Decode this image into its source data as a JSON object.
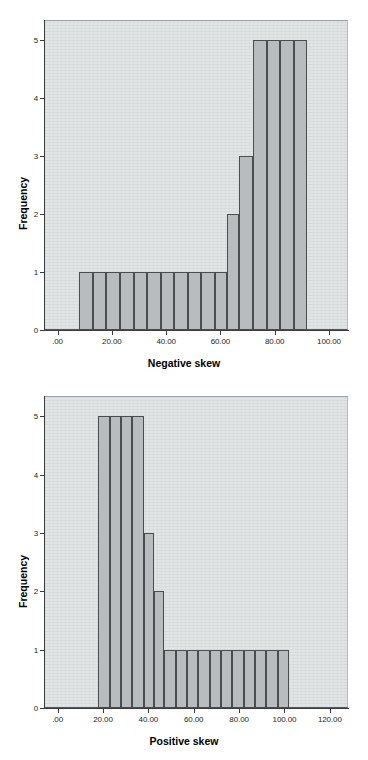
{
  "figure": {
    "background_color": "#ffffff",
    "plot_background_color": "#e2e5e6",
    "bar_fill_color": "#b9bcbe",
    "bar_border_color": "#4a4d50",
    "axis_color": "#3a3d40"
  },
  "charts": [
    {
      "id": "negative-skew-histogram",
      "title": "",
      "xlabel": "Negative skew",
      "ylabel": "Frequency",
      "x_tick_labels": [
        ".00",
        "20.00",
        "40.00",
        "60.00",
        "80.00",
        "100.00"
      ],
      "x_tick_values": [
        0,
        20,
        40,
        60,
        80,
        100
      ],
      "y_tick_labels": [
        "0",
        "1",
        "2",
        "3",
        "4",
        "5"
      ],
      "y_tick_values": [
        0,
        1,
        2,
        3,
        4,
        5
      ]
    },
    {
      "id": "positive-skew-histogram",
      "title": "",
      "xlabel": "Positive skew",
      "ylabel": "Frequency",
      "x_tick_labels": [
        ".00",
        "20.00",
        "40.00",
        "60.00",
        "80.00",
        "100.00",
        "120.00"
      ],
      "x_tick_values": [
        0,
        20,
        40,
        60,
        80,
        100,
        120
      ],
      "y_tick_labels": [
        "0",
        "1",
        "2",
        "3",
        "4",
        "5"
      ],
      "y_tick_values": [
        0,
        1,
        2,
        3,
        4,
        5
      ]
    }
  ],
  "chart_data": [
    {
      "type": "bar",
      "id": "negative-skew-histogram",
      "title": "Negative skew",
      "xlabel": "Negative skew",
      "ylabel": "Frequency",
      "xlim": [
        -5,
        107
      ],
      "ylim": [
        0,
        5.35
      ],
      "grid": false,
      "legend": "none",
      "bin_width": 5,
      "bin_edges": [
        8,
        13,
        18,
        23,
        28,
        33,
        38,
        43,
        48,
        53,
        58,
        62.5,
        67,
        72,
        77,
        82,
        87,
        92
      ],
      "categories": [
        "8-13",
        "13-18",
        "18-23",
        "23-28",
        "28-33",
        "33-38",
        "38-43",
        "43-48",
        "48-53",
        "53-58",
        "58-62.5",
        "62.5-67",
        "67-72",
        "72-77",
        "77-82",
        "82-87",
        "87-92"
      ],
      "values": [
        1,
        1,
        1,
        1,
        1,
        1,
        1,
        1,
        1,
        1,
        1,
        2,
        3,
        5,
        5,
        5,
        5
      ]
    },
    {
      "type": "bar",
      "id": "positive-skew-histogram",
      "title": "Positive skew",
      "xlabel": "Positive skew",
      "ylabel": "Frequency",
      "xlim": [
        -6,
        128
      ],
      "ylim": [
        0,
        5.35
      ],
      "grid": false,
      "legend": "none",
      "bin_width": 5,
      "bin_edges": [
        18,
        23,
        28,
        33,
        38,
        42.5,
        47,
        52,
        57,
        62,
        67,
        72,
        77,
        82,
        87,
        92,
        97,
        102
      ],
      "categories": [
        "18-23",
        "23-28",
        "28-33",
        "33-38",
        "38-42.5",
        "42.5-47",
        "47-52",
        "52-57",
        "57-62",
        "62-67",
        "67-72",
        "72-77",
        "77-82",
        "82-87",
        "87-92",
        "92-97",
        "97-102"
      ],
      "values": [
        5,
        5,
        5,
        5,
        3,
        2,
        1,
        1,
        1,
        1,
        1,
        1,
        1,
        1,
        1,
        1,
        1
      ]
    }
  ]
}
